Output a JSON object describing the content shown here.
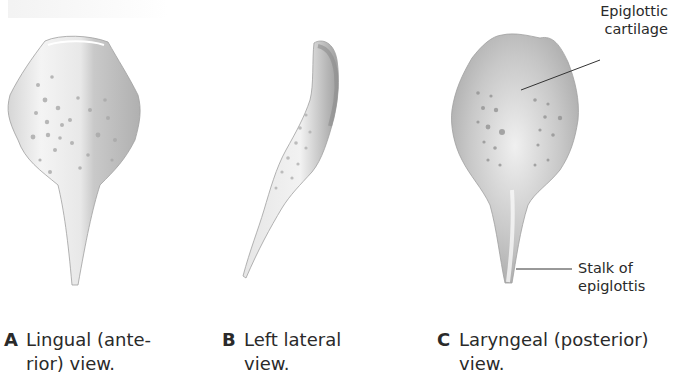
{
  "figure": {
    "panels": [
      {
        "letter": "A",
        "caption_line1": "Lingual (ante-",
        "caption_line2": "rior) view."
      },
      {
        "letter": "B",
        "caption_line1": "Left lateral",
        "caption_line2": "view."
      },
      {
        "letter": "C",
        "caption_line1": "Laryngeal (posterior)",
        "caption_line2": "view."
      }
    ],
    "labels": {
      "epiglottic_cartilage_line1": "Epiglottic",
      "epiglottic_cartilage_line2": "cartilage",
      "stalk_line1": "Stalk of",
      "stalk_line2": "epiglottis"
    },
    "colors": {
      "cartilage_light": "#f2f2f2",
      "cartilage_mid": "#cfcfcf",
      "cartilage_dark": "#9a9a9a",
      "leader_line": "#333333"
    }
  }
}
